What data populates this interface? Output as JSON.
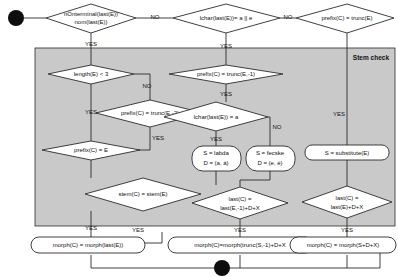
{
  "diagram": {
    "panel_label": "Stem check",
    "colors": {
      "panel_fill": "#c9c9c9",
      "node_fill": "#ffffff",
      "stroke": "#2b2b2b",
      "text": "#111111"
    }
  },
  "nodes": {
    "start_dot": "",
    "d_nonterminal_l1": "nOnterminal(last(E))",
    "d_nonterminal_l2": "nom(last(E))",
    "d_lchar_ae": "lchar(last(E))= a || e",
    "d_prefix_trunc_e": "prefix(C) = trunc(E)",
    "d_length_lt3": "length(E) < 3",
    "d_prefix_trunc_e2": "prefix(C) = trunc(E,-2)",
    "d_prefix_eq_e": "prefix(C) = E",
    "d_stem_eq": "stem(C) = stem(E)",
    "d_prefix_trunc_e1": "prefix(C) = trunc(E,-1)",
    "d_lchar_a": "lchar(last(E)) = a",
    "b_s_labda_l1": "S = labda",
    "b_s_labda_l2": "D = (a, á)",
    "b_s_fecske_l1": "S = fecske",
    "b_s_fecske_l2": "D = (e, é)",
    "b_s_substitute": "S = substitute(E)",
    "d_last_c_mid_l1": "last(C) =",
    "d_last_c_mid_l2": "last(E,-1)+D+X",
    "d_last_c_right_l1": "last(C) =",
    "d_last_c_right_l2": "last(E)+D+X",
    "b_morph_left": "morph(C) = morph(last(E))",
    "b_morph_mid": "morph(C)=morph(trunc(S,-1)+D+X",
    "b_morph_right": "morph(C) = morph(S+D+X)",
    "end_dot": ""
  },
  "edge_labels": {
    "no_1": "NO",
    "no_2": "NO",
    "yes_1": "YES",
    "yes_2": "YES",
    "yes_len": "YES",
    "no_len": "NO",
    "yes_prefix_e2": "YES",
    "yes_stem": "YES",
    "yes_prefix_trunc1": "YES",
    "no_lchar_a": "NO",
    "yes_lchar_a": "YES",
    "yes_right_col": "YES",
    "yes_bottom_left": "YES",
    "yes_bottom_mid": "YES",
    "yes_bottom_right": "YES"
  }
}
